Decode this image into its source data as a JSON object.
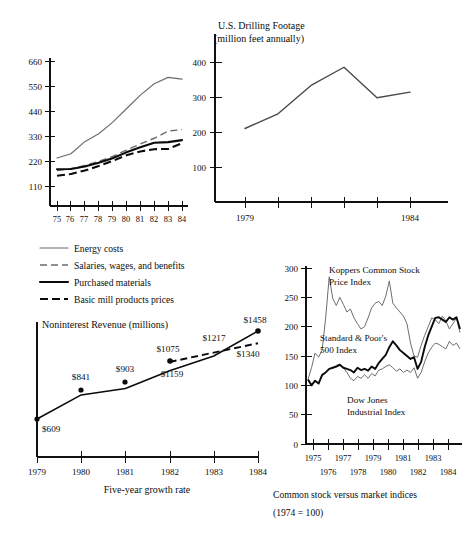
{
  "figure": {
    "caption_line1": "Common stock versus market indices",
    "caption_line2": "(1974 = 100)"
  },
  "chart_data": [
    {
      "id": "cost-index",
      "type": "line",
      "title": "",
      "xlabel": "",
      "ylabel": "",
      "x": [
        "75",
        "76",
        "77",
        "78",
        "79",
        "80",
        "81",
        "82",
        "83",
        "84"
      ],
      "xtick_labels": [
        "75",
        "76",
        "77",
        "78",
        "79",
        "80",
        "81",
        "82",
        "83",
        "84"
      ],
      "ytick_labels": [
        "110",
        "220",
        "330",
        "440",
        "550",
        "660"
      ],
      "ytick_values": [
        110,
        220,
        330,
        440,
        550,
        660
      ],
      "ylim": [
        0,
        700
      ],
      "grid": false,
      "legend_position": "below",
      "series": [
        {
          "name": "Energy costs",
          "style": "thin-solid",
          "color": "#6b6b6b",
          "values": [
            233,
            252,
            305,
            340,
            390,
            450,
            510,
            560,
            588,
            580
          ]
        },
        {
          "name": "Salaries, wages, and benefits",
          "style": "thin-dashed",
          "color": "#6b6b6b",
          "values": [
            178,
            186,
            200,
            218,
            240,
            268,
            295,
            320,
            352,
            358
          ]
        },
        {
          "name": "Purchased materials",
          "style": "bold-solid",
          "color": "#0a0a0a",
          "values": [
            184,
            185,
            196,
            212,
            232,
            258,
            280,
            300,
            303,
            312
          ]
        },
        {
          "name": "Basic mill products prices",
          "style": "bold-dashed",
          "color": "#0a0a0a",
          "values": [
            155,
            163,
            178,
            198,
            220,
            245,
            262,
            272,
            273,
            298
          ]
        }
      ]
    },
    {
      "id": "drilling-footage",
      "type": "line",
      "title_line1": "U.S. Drilling Footage",
      "title_line2": "(million feet annually)",
      "xlabel": "",
      "ylabel": "",
      "x": [
        1979,
        1980,
        1981,
        1982,
        1983,
        1984
      ],
      "xtick_labels": [
        "1979",
        "",
        "",
        "",
        "",
        "1984"
      ],
      "ytick_labels": [
        "100",
        "200",
        "300",
        "400"
      ],
      "ytick_values": [
        100,
        200,
        300,
        400
      ],
      "ylim": [
        0,
        470
      ],
      "grid": false,
      "values": [
        210,
        252,
        333,
        385,
        298,
        314
      ]
    },
    {
      "id": "noninterest-revenue",
      "type": "line",
      "title": "Noninterest Revenue (millions)",
      "xlabel": "Five-year growth rate",
      "ylabel": "",
      "x": [
        1979,
        1980,
        1981,
        1982,
        1983,
        1984
      ],
      "xtick_labels": [
        "1979",
        "1980",
        "1981",
        "1982",
        "1983",
        "1984"
      ],
      "grid": false,
      "series": [
        {
          "name": "actual",
          "style": "solid",
          "values": [
            609,
            841,
            903,
            1075,
            1217,
            1458
          ],
          "point_labels": [
            "$609",
            "$841",
            "$903",
            "$1075",
            "$1217",
            "$1458"
          ]
        },
        {
          "name": "projected",
          "style": "dashed",
          "values": [
            null,
            null,
            null,
            1159,
            null,
            1340
          ],
          "point_labels": [
            "",
            "",
            "",
            "$1159",
            "",
            "$1340"
          ]
        }
      ]
    },
    {
      "id": "common-stock-indices",
      "type": "line",
      "title": "",
      "xlabel": "",
      "ylabel": "",
      "xtick_labels_top": [
        "1975",
        "1977",
        "1979",
        "1981",
        "1983"
      ],
      "xtick_labels_bottom": [
        "1976",
        "1978",
        "1980",
        "1982",
        "1984"
      ],
      "ytick_labels": [
        "0",
        "50",
        "100",
        "150",
        "200",
        "250",
        "300"
      ],
      "ytick_values": [
        0,
        50,
        100,
        150,
        200,
        250,
        300
      ],
      "ylim": [
        0,
        310
      ],
      "xlim": [
        1974,
        1985
      ],
      "grid": false,
      "annotations": [
        {
          "text_line1": "Koppers Common Stock",
          "text_line2": "Price Index"
        },
        {
          "text_line1": "Standard & Poor's",
          "text_line2": "500 Index"
        },
        {
          "text_line1": "Dow Jones",
          "text_line2": "Industrial Index"
        }
      ],
      "series": [
        {
          "name": "Koppers Common Stock Price Index",
          "style": "grey",
          "color": "#6e6e6e",
          "values": [
            110,
            130,
            155,
            148,
            160,
            215,
            285,
            248,
            236,
            250,
            238,
            225,
            230,
            215,
            205,
            196,
            200,
            215,
            232,
            240,
            243,
            236,
            252,
            278,
            240,
            232,
            225,
            218,
            205,
            172,
            150,
            148,
            168,
            185,
            200,
            215,
            212,
            205,
            218,
            210,
            196,
            205,
            215,
            190
          ]
        },
        {
          "name": "Standard & Poor's 500 Index",
          "style": "dark",
          "color": "#0a0a0a",
          "values": [
            110,
            100,
            108,
            103,
            118,
            122,
            128,
            130,
            132,
            135,
            130,
            128,
            126,
            122,
            130,
            126,
            128,
            125,
            132,
            128,
            138,
            145,
            152,
            165,
            175,
            168,
            160,
            155,
            150,
            145,
            148,
            128,
            140,
            165,
            185,
            200,
            215,
            216,
            212,
            208,
            216,
            212,
            216,
            196
          ]
        },
        {
          "name": "Dow Jones Industrial Index",
          "style": "grey",
          "color": "#6e6e6e",
          "values": [
            108,
            100,
            106,
            104,
            115,
            122,
            128,
            130,
            134,
            136,
            130,
            122,
            112,
            108,
            115,
            112,
            118,
            112,
            120,
            116,
            126,
            128,
            132,
            135,
            130,
            124,
            128,
            122,
            126,
            122,
            130,
            112,
            122,
            140,
            155,
            165,
            172,
            170,
            166,
            162,
            175,
            168,
            172,
            162
          ]
        }
      ]
    }
  ],
  "legend": {
    "items": [
      {
        "label": "Energy costs",
        "style": "thin-solid"
      },
      {
        "label": "Salaries, wages, and benefits",
        "style": "thin-dashed"
      },
      {
        "label": "Purchased materials",
        "style": "bold-solid"
      },
      {
        "label": "Basic mill products prices",
        "style": "bold-dashed"
      }
    ]
  }
}
